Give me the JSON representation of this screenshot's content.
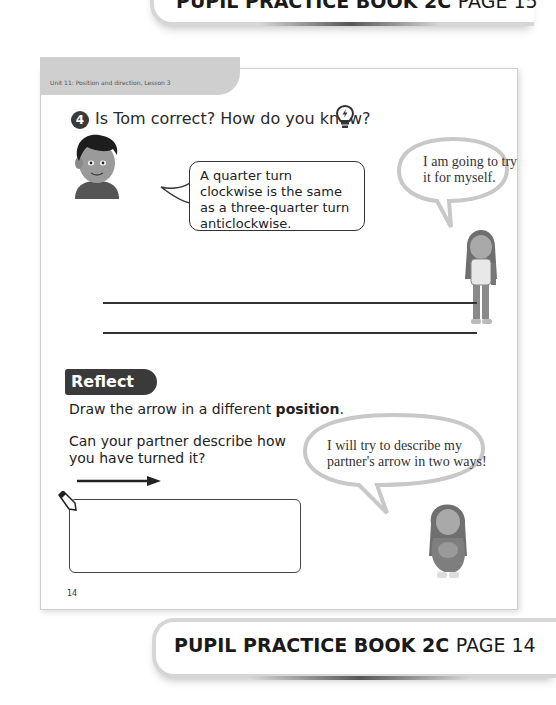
{
  "top_banner": {
    "book": "PUPIL PRACTICE BOOK 2C",
    "page": "PAGE 15"
  },
  "page": {
    "unit_label": "Unit 11: Position and direction, Lesson 3",
    "question": {
      "number": "4",
      "text": "Is Tom correct? How do you know?",
      "hint_icon": "lightbulb-icon",
      "tom_speech": "A quarter turn clockwise is the same as a three-quarter turn anticlockwise.",
      "girl_thought": "I am going to try it for myself.",
      "answer_lines": 2
    },
    "reflect": {
      "heading": "Reflect",
      "instruction_prefix": "Draw the arrow in a different ",
      "instruction_bold": "position",
      "instruction_suffix": ".",
      "question": "Can your partner describe how you have turned it?",
      "arrow_icon": "right-arrow-icon",
      "pencil_icon": "pencil-icon",
      "girl_thought": "I will try to describe my partner's arrow in two ways!"
    },
    "page_number": "14"
  },
  "bottom_banner": {
    "book": "PUPIL PRACTICE BOOK 2C",
    "page": "PAGE 14"
  },
  "colors": {
    "dark_badge": "#3a3a3a",
    "tab_gray": "#cfcfcf",
    "text": "#222222"
  }
}
